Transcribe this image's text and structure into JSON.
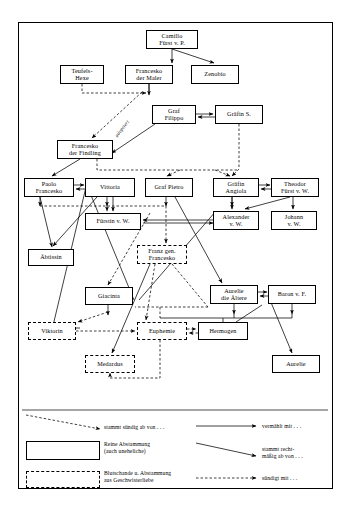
{
  "diagram": {
    "nodes": [
      {
        "id": "camillo",
        "label": "Camillo\nFürst v. P.",
        "line1": "Camillo",
        "line2": "Fürst v. P.",
        "style": "solid",
        "x": 146,
        "y": 30,
        "w": 52,
        "h": 19
      },
      {
        "id": "teufelshexe",
        "label": "Teufels-\nHexe",
        "line1": "Teufels-",
        "line2": "Hexe",
        "style": "solid",
        "x": 60,
        "y": 65,
        "w": 44,
        "h": 19
      },
      {
        "id": "maler",
        "label": "Francesko\nder Maler",
        "line1": "Francesko",
        "line2": "der Maler",
        "style": "solid",
        "x": 125,
        "y": 65,
        "w": 48,
        "h": 19
      },
      {
        "id": "zenobio",
        "label": "Zenobio",
        "line1": "Zenobio",
        "line2": "",
        "style": "solid",
        "x": 191,
        "y": 65,
        "w": 48,
        "h": 19
      },
      {
        "id": "filippo",
        "label": "Graf\nFilippo",
        "line1": "Graf",
        "line2": "Filippo",
        "style": "solid",
        "x": 152,
        "y": 105,
        "w": 44,
        "h": 19
      },
      {
        "id": "graefins",
        "label": "Gräfin S.",
        "line1": "Gräfin S.",
        "line2": "",
        "style": "solid",
        "x": 215,
        "y": 105,
        "w": 48,
        "h": 19
      },
      {
        "id": "findling",
        "label": "Francesko\nder Findling",
        "line1": "Francesko",
        "line2": "der Findling",
        "style": "solid",
        "x": 57,
        "y": 140,
        "w": 56,
        "h": 19
      },
      {
        "id": "paolo",
        "label": "Paolo\nFrancesko",
        "line1": "Paolo",
        "line2": "Francesko",
        "style": "solid",
        "x": 24,
        "y": 178,
        "w": 50,
        "h": 19
      },
      {
        "id": "vittoria",
        "label": "Vittoria",
        "line1": "Vittoria",
        "line2": "",
        "style": "solid",
        "x": 85,
        "y": 178,
        "w": 50,
        "h": 19
      },
      {
        "id": "pietro",
        "label": "Graf Pietro",
        "line1": "Graf Pietro",
        "line2": "",
        "style": "solid",
        "x": 145,
        "y": 178,
        "w": 48,
        "h": 19
      },
      {
        "id": "angiola",
        "label": "Gräfin\nAngiola",
        "line1": "Gräfin",
        "line2": "Angiola",
        "style": "solid",
        "x": 213,
        "y": 178,
        "w": 46,
        "h": 19
      },
      {
        "id": "theodor",
        "label": "Theodor\nFürst v. W.",
        "line1": "Theodor",
        "line2": "Fürst v. W.",
        "style": "solid",
        "x": 271,
        "y": 178,
        "w": 48,
        "h": 19
      },
      {
        "id": "fuerstin",
        "label": "Fürstin v. W.",
        "line1": "Fürstin v. W.",
        "line2": "",
        "style": "solid",
        "x": 85,
        "y": 213,
        "w": 56,
        "h": 17
      },
      {
        "id": "alexander",
        "label": "Alexander\nv. W.",
        "line1": "Alexander",
        "line2": "v. W.",
        "style": "solid",
        "x": 213,
        "y": 211,
        "w": 46,
        "h": 19
      },
      {
        "id": "johann",
        "label": "Johann\nv. W.",
        "line1": "Johann",
        "line2": "v. W.",
        "style": "solid",
        "x": 271,
        "y": 211,
        "w": 46,
        "h": 19
      },
      {
        "id": "aebtissin",
        "label": "Äbtissin",
        "line1": "Äbtissin",
        "line2": "",
        "style": "solid",
        "x": 28,
        "y": 249,
        "w": 46,
        "h": 17
      },
      {
        "id": "franz",
        "label": "Franz gen.\nFrancesko",
        "line1": "Franz gen.",
        "line2": "Francesko",
        "style": "dashed",
        "x": 137,
        "y": 245,
        "w": 50,
        "h": 19
      },
      {
        "id": "giacinta",
        "label": "Giacinta",
        "line1": "Giacinta",
        "line2": "",
        "style": "solid",
        "x": 85,
        "y": 287,
        "w": 48,
        "h": 18
      },
      {
        "id": "aurelie_ae",
        "label": "Aurelie\ndie Ältere",
        "line1": "Aurelie",
        "line2": "die Ältere",
        "style": "solid",
        "x": 210,
        "y": 285,
        "w": 48,
        "h": 19
      },
      {
        "id": "baron",
        "label": "Baron v. F.",
        "line1": "Baron v. F.",
        "line2": "",
        "style": "solid",
        "x": 268,
        "y": 285,
        "w": 48,
        "h": 19
      },
      {
        "id": "viktorin",
        "label": "Viktorin",
        "line1": "Viktorin",
        "line2": "",
        "style": "dashed",
        "x": 28,
        "y": 322,
        "w": 48,
        "h": 18
      },
      {
        "id": "euphemie",
        "label": "Euphemie",
        "line1": "Euphemie",
        "line2": "",
        "style": "dashed",
        "x": 137,
        "y": 322,
        "w": 50,
        "h": 18
      },
      {
        "id": "hermogen",
        "label": "Hermogen",
        "line1": "Hermogen",
        "line2": "",
        "style": "solid",
        "x": 198,
        "y": 322,
        "w": 50,
        "h": 18
      },
      {
        "id": "medardus",
        "label": "Medardus",
        "line1": "Medardus",
        "line2": "",
        "style": "dashed",
        "x": 85,
        "y": 355,
        "w": 50,
        "h": 18
      },
      {
        "id": "aurelie",
        "label": "Aurelie",
        "line1": "Aurelie",
        "line2": "",
        "style": "solid",
        "x": 272,
        "y": 355,
        "w": 48,
        "h": 18
      }
    ],
    "edge_label": "adoptiert"
  },
  "legend": {
    "items": [
      {
        "id": "descent-sinful",
        "symbol": "dashed-arrow-diagonal",
        "text": "stammt sündig ab von . . ."
      },
      {
        "id": "pure-descent",
        "symbol": "solid-box",
        "text": "Reine Abstammung\n(auch uneheliche)"
      },
      {
        "id": "incest-descent",
        "symbol": "dashed-box",
        "text": "Blutschande u. Abstammung\naus Geschwisterliebe"
      },
      {
        "id": "married",
        "symbol": "solid-arrow",
        "text": "vermählt mit . . ."
      },
      {
        "id": "lawful-descent",
        "symbol": "solid-arrow-diagonal",
        "text": "stammt recht-\nmäßig ab von . . ."
      },
      {
        "id": "sins-with",
        "symbol": "dashed-arrow",
        "text": "sündigt mit . . ."
      }
    ]
  }
}
